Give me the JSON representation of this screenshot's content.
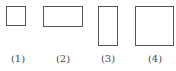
{
  "figure": {
    "shapes": [
      {
        "id": 1,
        "kind": "square",
        "label": "(1)",
        "x": 6,
        "y": 6,
        "w": 20,
        "h": 20,
        "label_cx": 18
      },
      {
        "id": 2,
        "kind": "rectangle-horizontal",
        "label": "(2)",
        "x": 43,
        "y": 6,
        "w": 40,
        "h": 21,
        "label_cx": 63
      },
      {
        "id": 3,
        "kind": "rectangle-vertical",
        "label": "(3)",
        "x": 98,
        "y": 6,
        "w": 20,
        "h": 40,
        "label_cx": 108
      },
      {
        "id": 4,
        "kind": "square-large",
        "label": "(4)",
        "x": 135,
        "y": 6,
        "w": 39,
        "h": 40,
        "label_cx": 155
      }
    ],
    "stroke_color": "#555555",
    "background": "#ffffff"
  }
}
